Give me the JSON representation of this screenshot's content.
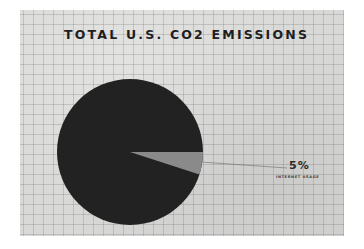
{
  "chart_data": {
    "type": "pie",
    "title": "TOTAL U.S. CO2 EMISSIONS",
    "slices": [
      {
        "label": "Other",
        "value": 95,
        "color": "#222222"
      },
      {
        "label": "INTERNET USAGE",
        "value": 5,
        "color": "#8a8a8a"
      }
    ],
    "annotations": [
      {
        "text": "5%",
        "sublabel": "INTERNET USAGE",
        "target_slice": "INTERNET USAGE"
      }
    ],
    "background": "graph paper grid",
    "legend": "none"
  },
  "labels": {
    "title": "TOTAL U.S. CO2 EMISSIONS",
    "highlight_value": "5%",
    "highlight_label": "INTERNET USAGE"
  }
}
